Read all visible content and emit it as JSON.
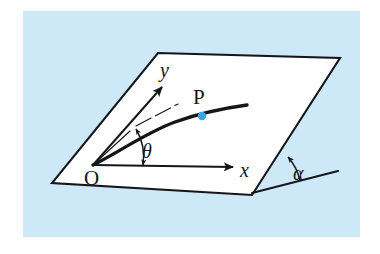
{
  "figure": {
    "canvas": {
      "width": 380,
      "height": 254
    },
    "colors": {
      "background": "#ffffff",
      "panel": "#cde8f7",
      "plane_fill": "#ffffff",
      "ink": "#15161a",
      "point_marker": "#3aa6e0"
    },
    "panel": {
      "x": 23,
      "y": 11,
      "width": 337,
      "height": 226
    }
  },
  "plane": {
    "name": "inclined-plane",
    "vertices": [
      {
        "x": 158,
        "y": 53
      },
      {
        "x": 340,
        "y": 58
      },
      {
        "x": 252,
        "y": 195
      },
      {
        "x": 52,
        "y": 183
      }
    ],
    "points_attr": "158,53 340,58 252,195 52,183"
  },
  "labels": {
    "origin": "O",
    "x_axis": "x",
    "y_axis": "y",
    "point_p": "P",
    "theta": "θ",
    "alpha": "α"
  },
  "axes": {
    "x_axis": {
      "from": {
        "x": 93,
        "y": 165
      },
      "to": {
        "x": 237,
        "y": 167
      },
      "label": "x"
    },
    "y_axis": {
      "from": {
        "x": 93,
        "y": 165
      },
      "to": {
        "x": 165,
        "y": 83
      },
      "label": "y"
    }
  },
  "trajectory": {
    "name": "projectile-path",
    "start": {
      "x": 93,
      "y": 165
    },
    "end": {
      "x": 247,
      "y": 106
    },
    "path_d": "M 93 165 C 118 153 145 133 175 122 C 200 113 225 108 247 105"
  },
  "marker_p": {
    "x": 202,
    "y": 116,
    "radius": 4.2,
    "label": "P"
  },
  "tangent_line": {
    "name": "launch-direction-line",
    "from": {
      "x": 93,
      "y": 165
    },
    "to": {
      "x": 176,
      "y": 105
    },
    "dash_from": {
      "x": 131,
      "y": 129
    },
    "dash_to": {
      "x": 140,
      "y": 122
    }
  },
  "angle_theta": {
    "label": "θ",
    "arc_d": "M 145 163 A 52 52 0 0 0 139 130",
    "label_pos": {
      "x": 152,
      "y": 152
    }
  },
  "angle_alpha": {
    "label": "α",
    "vertex": {
      "x": 252,
      "y": 193
    },
    "ground_line": {
      "from": {
        "x": 252,
        "y": 193
      },
      "to": {
        "x": 338,
        "y": 171
      }
    },
    "arc_d": "M 300 181 A 52 52 0 0 0 288 157",
    "label_pos": {
      "x": 303,
      "y": 174
    }
  }
}
